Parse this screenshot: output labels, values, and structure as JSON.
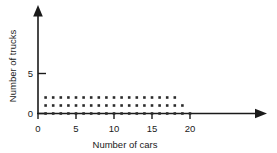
{
  "chart_data": {
    "type": "scatter",
    "title": "",
    "xlabel": "Number of cars",
    "ylabel": "Number of trucks",
    "xlim": [
      0,
      23.5
    ],
    "ylim": [
      0,
      8.5
    ],
    "grid": false,
    "legend": "none",
    "xticks": [
      0,
      5,
      10,
      15,
      20
    ],
    "xticklabels": [
      "0",
      "5",
      "10",
      "15",
      "20"
    ],
    "yticks": [
      0,
      5
    ],
    "yticklabels": [
      "0",
      "5"
    ],
    "marker": "square-dot",
    "marker_color": "#2b2b2b",
    "axis_color": "#1a1a1a",
    "axis_arrows": true,
    "series": [
      {
        "name": "feasible integer points",
        "points": [
          [
            1,
            0
          ],
          [
            2,
            0
          ],
          [
            3,
            0
          ],
          [
            4,
            0
          ],
          [
            5,
            0
          ],
          [
            6,
            0
          ],
          [
            7,
            0
          ],
          [
            8,
            0
          ],
          [
            9,
            0
          ],
          [
            10,
            0
          ],
          [
            11,
            0
          ],
          [
            12,
            0
          ],
          [
            13,
            0
          ],
          [
            14,
            0
          ],
          [
            15,
            0
          ],
          [
            16,
            0
          ],
          [
            17,
            0
          ],
          [
            18,
            0
          ],
          [
            19,
            0
          ],
          [
            20,
            0
          ],
          [
            1,
            1
          ],
          [
            2,
            1
          ],
          [
            3,
            1
          ],
          [
            4,
            1
          ],
          [
            5,
            1
          ],
          [
            6,
            1
          ],
          [
            7,
            1
          ],
          [
            8,
            1
          ],
          [
            9,
            1
          ],
          [
            10,
            1
          ],
          [
            11,
            1
          ],
          [
            12,
            1
          ],
          [
            13,
            1
          ],
          [
            14,
            1
          ],
          [
            15,
            1
          ],
          [
            16,
            1
          ],
          [
            17,
            1
          ],
          [
            18,
            1
          ],
          [
            19,
            1
          ],
          [
            1,
            2
          ],
          [
            2,
            2
          ],
          [
            3,
            2
          ],
          [
            4,
            2
          ],
          [
            5,
            2
          ],
          [
            6,
            2
          ],
          [
            7,
            2
          ],
          [
            8,
            2
          ],
          [
            9,
            2
          ],
          [
            10,
            2
          ],
          [
            11,
            2
          ],
          [
            12,
            2
          ],
          [
            13,
            2
          ],
          [
            14,
            2
          ],
          [
            15,
            2
          ],
          [
            16,
            2
          ],
          [
            17,
            2
          ],
          [
            18,
            2
          ]
        ]
      }
    ]
  },
  "axes": {
    "x_title": "Number of cars",
    "y_title": "Number of trucks"
  }
}
